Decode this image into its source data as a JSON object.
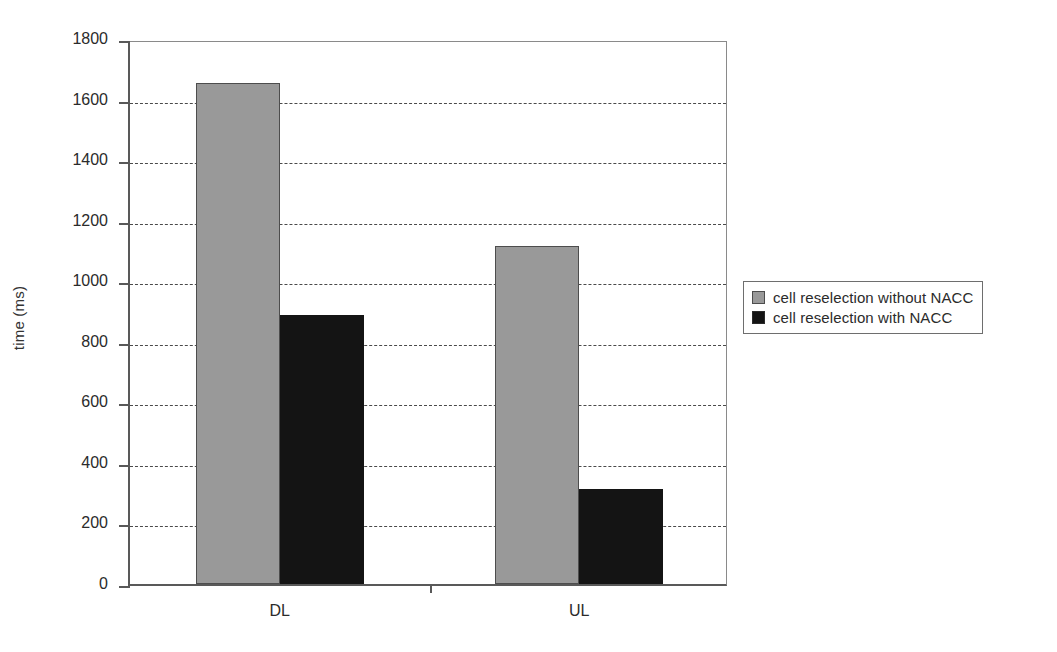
{
  "chart_data": {
    "type": "bar",
    "title": "",
    "subtitle": "",
    "xlabel": "",
    "ylabel": "time (ms)",
    "categories": [
      "DL",
      "UL"
    ],
    "series": [
      {
        "name": "cell reselection without NACC",
        "color": "#999999",
        "values": [
          1655,
          1115
        ]
      },
      {
        "name": "cell reselection with NACC",
        "color": "#141414",
        "values": [
          890,
          315
        ]
      }
    ],
    "ylim": [
      0,
      1800
    ],
    "ytick_values": [
      0,
      200,
      400,
      600,
      800,
      1000,
      1200,
      1400,
      1600,
      1800
    ],
    "ytick_labels": [
      "0",
      "200",
      "400",
      "600",
      "800",
      "1000",
      "1200",
      "1400",
      "1600",
      "1800"
    ],
    "grid": true,
    "grid_style": "dashed-horizontal",
    "legend_position": "right-outside",
    "legend_entries": [
      "cell reselection without NACC",
      "cell reselection with NACC"
    ]
  },
  "legend": {
    "items": [
      {
        "label": "cell reselection without NACC",
        "swatch": "light-gray-square-icon"
      },
      {
        "label": "cell reselection with NACC",
        "swatch": "dark-square-icon"
      }
    ]
  },
  "axes": {
    "y_title": "time (ms)",
    "y_ticks": [
      "1800",
      "1600",
      "1400",
      "1200",
      "1000",
      "800",
      "600",
      "400",
      "200",
      "0"
    ],
    "x_categories": [
      "DL",
      "UL"
    ]
  }
}
